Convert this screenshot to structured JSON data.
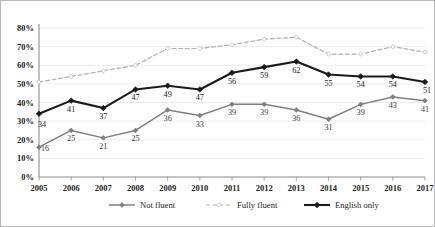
{
  "chart_data": {
    "type": "line",
    "title": "",
    "xlabel": "",
    "ylabel": "",
    "categories": [
      "2005",
      "2006",
      "2007",
      "2008",
      "2009",
      "2010",
      "2011",
      "2012",
      "2013",
      "2014",
      "2015",
      "2016",
      "2017"
    ],
    "ylim": [
      0,
      80
    ],
    "yticks": [
      "0%",
      "10%",
      "20%",
      "30%",
      "40%",
      "50%",
      "60%",
      "70%",
      "80%"
    ],
    "ytick_values": [
      0,
      10,
      20,
      30,
      40,
      50,
      60,
      70,
      80
    ],
    "grid": true,
    "legend_position": "bottom",
    "series": [
      {
        "name": "Not fluent",
        "color": "#7f7f7f",
        "style": "solid",
        "marker": "diamond",
        "labels_shown": true,
        "values": [
          16,
          25,
          21,
          25,
          36,
          33,
          39,
          39,
          36,
          31,
          39,
          43,
          41
        ]
      },
      {
        "name": "Fully fluent",
        "color": "#b0b0b0",
        "style": "dashed",
        "marker": "diamond",
        "labels_shown": false,
        "values": [
          51,
          54,
          57,
          60,
          69,
          69,
          71,
          74,
          75,
          66,
          66,
          70,
          67
        ]
      },
      {
        "name": "English only",
        "color": "#1a1a1a",
        "style": "solid",
        "marker": "diamond",
        "labels_shown": true,
        "values": [
          34,
          41,
          37,
          47,
          49,
          47,
          56,
          59,
          62,
          55,
          54,
          54,
          51
        ]
      }
    ]
  },
  "legend": {
    "items": [
      {
        "label": "Not fluent"
      },
      {
        "label": "Fully fluent"
      },
      {
        "label": "English only"
      }
    ]
  }
}
